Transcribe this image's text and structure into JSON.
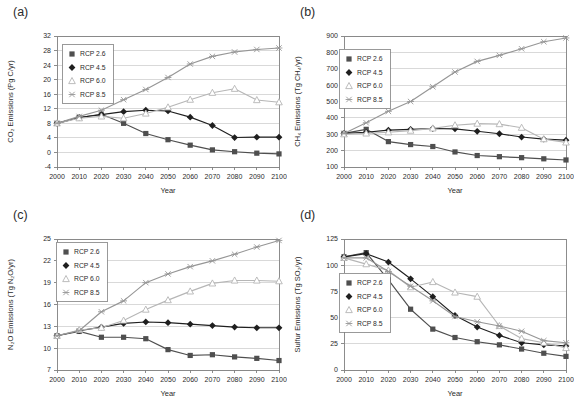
{
  "figure": {
    "xlabel": "Year",
    "legend_labels": [
      "RCP 2.6",
      "RCP 4.5",
      "RCP 6.0",
      "RCP 8.5"
    ],
    "background_color": "#ffffff",
    "gridline_color": "#c9c9c9",
    "axis_color": "#7f7f7f"
  },
  "series_styles": [
    {
      "name": "RCP 2.6",
      "color": "#4f4f4f",
      "marker": "square-filled"
    },
    {
      "name": "RCP 4.5",
      "color": "#1f1f1f",
      "marker": "diamond-filled"
    },
    {
      "name": "RCP 6.0",
      "color": "#b6b6b6",
      "marker": "triangle-open"
    },
    {
      "name": "RCP 8.5",
      "color": "#969696",
      "marker": "x-star"
    }
  ],
  "chart_data": [
    {
      "type": "line",
      "panel": "(a)",
      "ylabel": "CO₂ Emissions (Pg C/yr)",
      "xlabel": "Year",
      "ylim": [
        -4,
        32
      ],
      "ytick_step": 4,
      "grid": "horizontal",
      "legend_position": "upper-left",
      "legend_xy": [
        62,
        44
      ],
      "x": [
        2000,
        2010,
        2020,
        2030,
        2040,
        2050,
        2060,
        2070,
        2080,
        2090,
        2100
      ],
      "series": [
        {
          "name": "RCP 2.6",
          "values": [
            8.0,
            9.6,
            10.5,
            8.0,
            5.2,
            3.5,
            2.0,
            0.7,
            0.2,
            -0.2,
            -0.4
          ]
        },
        {
          "name": "RCP 4.5",
          "values": [
            8.0,
            9.6,
            10.4,
            11.2,
            11.6,
            11.4,
            9.7,
            7.4,
            4.1,
            4.2,
            4.2
          ]
        },
        {
          "name": "RCP 6.0",
          "values": [
            8.0,
            9.4,
            9.9,
            9.4,
            10.7,
            12.4,
            14.5,
            16.4,
            17.5,
            14.4,
            13.8
          ]
        },
        {
          "name": "RCP 8.5",
          "values": [
            8.0,
            9.9,
            11.6,
            14.5,
            17.3,
            20.6,
            24.3,
            26.4,
            27.6,
            28.3,
            28.7
          ]
        }
      ]
    },
    {
      "type": "line",
      "panel": "(b)",
      "ylabel": "CH₄ Emissions (Tg CH₄/yr)",
      "xlabel": "Year",
      "ylim": [
        100,
        900
      ],
      "ytick_step": 100,
      "grid": "horizontal",
      "legend_position": "upper-left",
      "legend_xy": [
        52,
        49
      ],
      "x": [
        2000,
        2010,
        2020,
        2030,
        2040,
        2050,
        2060,
        2070,
        2080,
        2090,
        2100
      ],
      "series": [
        {
          "name": "RCP 2.6",
          "values": [
            305,
            330,
            255,
            237,
            225,
            192,
            170,
            163,
            157,
            150,
            143
          ]
        },
        {
          "name": "RCP 4.5",
          "values": [
            305,
            312,
            325,
            330,
            335,
            333,
            318,
            303,
            283,
            270,
            264
          ]
        },
        {
          "name": "RCP 6.0",
          "values": [
            300,
            305,
            312,
            322,
            336,
            355,
            365,
            362,
            340,
            270,
            250
          ]
        },
        {
          "name": "RCP 8.5",
          "values": [
            305,
            370,
            440,
            500,
            590,
            680,
            745,
            782,
            822,
            865,
            888
          ]
        }
      ]
    },
    {
      "type": "line",
      "panel": "(c)",
      "ylabel": "N₂O Emissions (Tg N₂O/yr)",
      "xlabel": "Year",
      "ylim": [
        7,
        25
      ],
      "ytick_step": 3,
      "grid": "horizontal",
      "legend_position": "upper-left",
      "legend_xy": [
        56,
        39
      ],
      "x": [
        2000,
        2010,
        2020,
        2030,
        2040,
        2050,
        2060,
        2070,
        2080,
        2090,
        2100
      ],
      "series": [
        {
          "name": "RCP 2.6",
          "values": [
            11.7,
            12.3,
            11.5,
            11.5,
            11.3,
            9.8,
            9.0,
            9.1,
            8.8,
            8.6,
            8.3
          ]
        },
        {
          "name": "RCP 4.5",
          "values": [
            11.7,
            12.4,
            12.9,
            13.4,
            13.6,
            13.5,
            13.3,
            13.1,
            12.9,
            12.8,
            12.8
          ]
        },
        {
          "name": "RCP 6.0",
          "values": [
            11.7,
            12.5,
            12.8,
            13.8,
            15.3,
            16.6,
            17.8,
            18.9,
            19.3,
            19.3,
            19.2
          ]
        },
        {
          "name": "RCP 8.5",
          "values": [
            11.7,
            12.4,
            15.0,
            16.5,
            19.0,
            20.2,
            21.2,
            22.0,
            22.9,
            23.9,
            24.8
          ]
        }
      ]
    },
    {
      "type": "line",
      "panel": "(d)",
      "ylabel": "Sulfur Emissions (Tg SO₂/yr)",
      "xlabel": "Year",
      "ylim": [
        0,
        125
      ],
      "ytick_step": 25,
      "grid": "horizontal",
      "legend_position": "lower-left",
      "legend_xy": [
        52,
        70
      ],
      "x": [
        2000,
        2010,
        2020,
        2030,
        2040,
        2050,
        2060,
        2070,
        2080,
        2090,
        2100
      ],
      "series": [
        {
          "name": "RCP 2.6",
          "values": [
            108,
            112,
            86,
            58,
            39,
            31,
            27,
            24,
            20,
            16,
            13
          ]
        },
        {
          "name": "RCP 4.5",
          "values": [
            108,
            111,
            103,
            87,
            70,
            52,
            41,
            33,
            26,
            24,
            23
          ]
        },
        {
          "name": "RCP 6.0",
          "values": [
            107,
            101,
            95,
            79,
            84,
            74,
            70,
            42,
            30,
            26,
            21
          ]
        },
        {
          "name": "RCP 8.5",
          "values": [
            107,
            107,
            94,
            80,
            66,
            51,
            46,
            42,
            37,
            28,
            26
          ]
        }
      ]
    }
  ]
}
